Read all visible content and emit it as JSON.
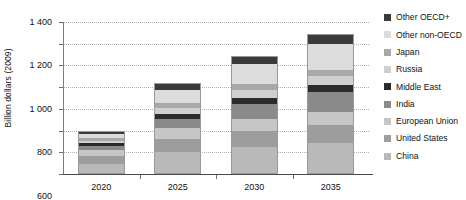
{
  "chart_data": {
    "type": "bar",
    "stacked": true,
    "title": "",
    "xlabel": "",
    "ylabel": "Billion dollars (2009)",
    "categories": [
      "2020",
      "2025",
      "2030",
      "2035"
    ],
    "ylim": [
      0,
      1400
    ],
    "yticks": [
      0,
      200,
      400,
      600,
      800,
      1000,
      1200,
      1400
    ],
    "ytick_labels": [
      "0",
      "200",
      "400",
      "600",
      "800",
      "1 000",
      "1 200",
      "1 400"
    ],
    "grid": true,
    "legend_position": "right",
    "series": [
      {
        "name": "China",
        "color": "#b9b9b9",
        "values": [
          95,
          205,
          250,
          285
        ]
      },
      {
        "name": "United States",
        "color": "#9d9d9d",
        "values": [
          70,
          120,
          145,
          165
        ]
      },
      {
        "name": "European Union",
        "color": "#c6c6c6",
        "values": [
          55,
          95,
          110,
          125
        ]
      },
      {
        "name": "India",
        "color": "#8a8a8a",
        "values": [
          40,
          90,
          140,
          185
        ]
      },
      {
        "name": "Middle East",
        "color": "#2b2b2b",
        "values": [
          22,
          45,
          55,
          62
        ]
      },
      {
        "name": "Russia",
        "color": "#cfcfcf",
        "values": [
          25,
          55,
          70,
          80
        ]
      },
      {
        "name": "Japan",
        "color": "#a8a8a8",
        "values": [
          25,
          45,
          55,
          58
        ]
      },
      {
        "name": "Other non-OECD",
        "color": "#dcdcdc",
        "values": [
          40,
          115,
          185,
          240
        ]
      },
      {
        "name": "Other OECD+",
        "color": "#3a3a3a",
        "values": [
          28,
          65,
          80,
          90
        ]
      }
    ],
    "totals": [
      400,
      835,
      1090,
      1290
    ]
  }
}
